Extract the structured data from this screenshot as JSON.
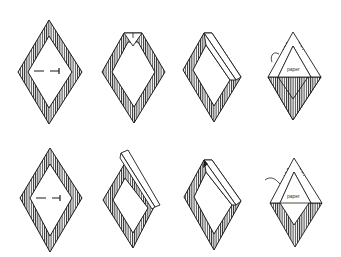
{
  "figure": {
    "rows": 2,
    "columns": 4,
    "colors": {
      "line": "#1a1a1a",
      "background": "#ffffff",
      "hatch": "#1a1a1a"
    }
  },
  "labels": {
    "top_row_paper": "paper",
    "bottom_row_paper": "paper"
  },
  "steps": [
    {
      "row": 1,
      "col": 1,
      "state": "flat diamond with dashed arrow"
    },
    {
      "row": 1,
      "col": 2,
      "state": "top corner folded down"
    },
    {
      "row": 1,
      "col": 3,
      "state": "upper-right edge folded over"
    },
    {
      "row": 1,
      "col": 4,
      "state": "both upper edges folded, paper label"
    },
    {
      "row": 2,
      "col": 1,
      "state": "flat diamond with dashed arrow"
    },
    {
      "row": 2,
      "col": 2,
      "state": "upper-right edge lifted"
    },
    {
      "row": 2,
      "col": 3,
      "state": "upper-right edge folded over"
    },
    {
      "row": 2,
      "col": 4,
      "state": "both upper edges folded, paper label"
    }
  ]
}
